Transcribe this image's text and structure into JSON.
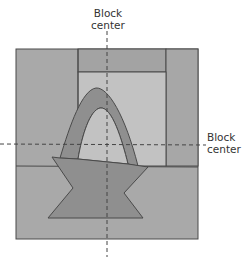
{
  "diagram": {
    "labels": {
      "vertical_center_line1": "Block",
      "vertical_center_line2": "center",
      "horizontal_center_line1": "Block",
      "horizontal_center_line2": "center"
    },
    "colors": {
      "background_block": "#a9a9a9",
      "top_band": "#a4a4a4",
      "inner_light": "#c3c3c3",
      "basket": "#8f8f8f",
      "outline": "#4a4a4a",
      "guide": "#444444"
    },
    "parts": [
      "outer square",
      "top band",
      "right column",
      "inner light square",
      "basket handle",
      "basket body",
      "bottom band"
    ]
  }
}
